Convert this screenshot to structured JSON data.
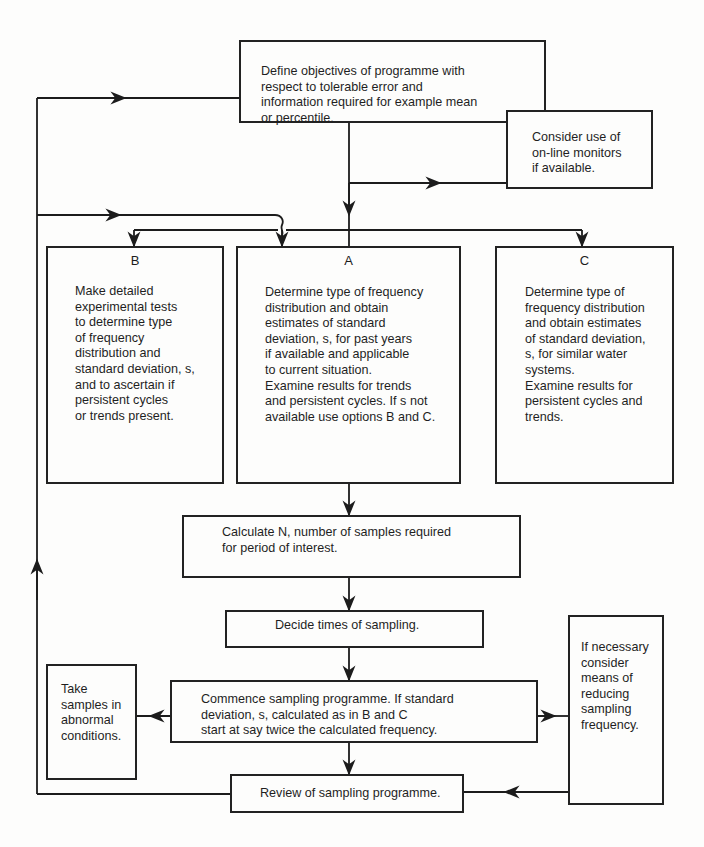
{
  "flowchart": {
    "objectives": "Define objectives of programme with\nrespect to tolerable error and\ninformation required for example mean\nor percentile.",
    "online_monitors": "Consider use of\non-line monitors\nif available.",
    "option_b": {
      "label": "B",
      "text": "Make detailed\nexperimental tests\nto determine type\nof frequency\ndistribution and\nstandard deviation, s,\nand to ascertain if\npersistent cycles\nor trends present."
    },
    "option_a": {
      "label": "A",
      "text": "Determine type of frequency\ndistribution and obtain\nestimates of standard\ndeviation, s, for past years\nif available and applicable\nto current situation.\nExamine results for trends\nand persistent cycles. If s not\navailable use options B and C."
    },
    "option_c": {
      "label": "C",
      "text": "Determine type of\nfrequency distribution\nand obtain estimates\nof standard deviation,\ns, for similar water\nsystems.\nExamine results for\npersistent cycles and\ntrends."
    },
    "calculate_n": "Calculate N, number of samples required\nfor period of interest.",
    "decide_times": "Decide times of sampling.",
    "commence": "Commence sampling programme. If standard\ndeviation, s, calculated as in B and C\nstart at say twice the calculated frequency.",
    "abnormal": "Take\nsamples in\nabnormal\nconditions.",
    "reduce_frequency": "If necessary\nconsider\nmeans of\nreducing\nsampling\nfrequency.",
    "review": "Review of sampling programme."
  }
}
